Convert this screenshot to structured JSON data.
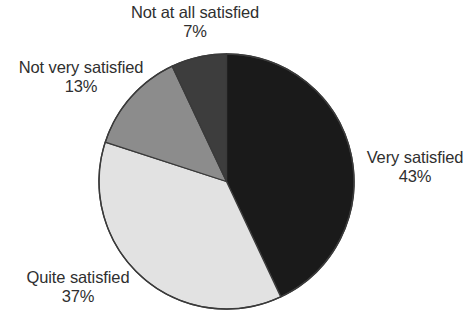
{
  "chart_data": {
    "type": "pie",
    "title": "",
    "subtitle": "",
    "xlabel": "",
    "ylabel": "",
    "legend_position": "none",
    "grid": false,
    "labels_show_percent": true,
    "start_angle_deg": 0,
    "direction": "clockwise",
    "categories": [
      "Very satisfied",
      "Quite satisfied",
      "Not very satisfied",
      "Not at all satisfied"
    ],
    "values": [
      43,
      37,
      13,
      7
    ],
    "value_labels": [
      "43%",
      "37%",
      "13%",
      "7%"
    ],
    "colors": [
      "#1a1a1a",
      "#e2e2e2",
      "#8c8c8c",
      "#3d3d3d"
    ],
    "slice_outline_color": "#3a3a3a",
    "background_color": "#ffffff",
    "text_color": "#2f2f2f",
    "slices": [
      {
        "label": "Very satisfied",
        "value": 43,
        "value_label": "43%",
        "color": "#1a1a1a",
        "start_deg": 0,
        "end_deg": 154.8
      },
      {
        "label": "Quite satisfied",
        "value": 37,
        "value_label": "37%",
        "color": "#e2e2e2",
        "start_deg": 154.8,
        "end_deg": 288.0
      },
      {
        "label": "Not very satisfied",
        "value": 13,
        "value_label": "13%",
        "color": "#8c8c8c",
        "start_deg": 288.0,
        "end_deg": 334.8
      },
      {
        "label": "Not at all satisfied",
        "value": 7,
        "value_label": "7%",
        "color": "#3d3d3d",
        "start_deg": 334.8,
        "end_deg": 360.0
      }
    ]
  },
  "labels": {
    "not_at_all": {
      "name": "Not at all satisfied",
      "value": "7%"
    },
    "not_very": {
      "name": "Not very satisfied",
      "value": "13%"
    },
    "very": {
      "name": "Very satisfied",
      "value": "43%"
    },
    "quite": {
      "name": "Quite satisfied",
      "value": "37%"
    }
  }
}
